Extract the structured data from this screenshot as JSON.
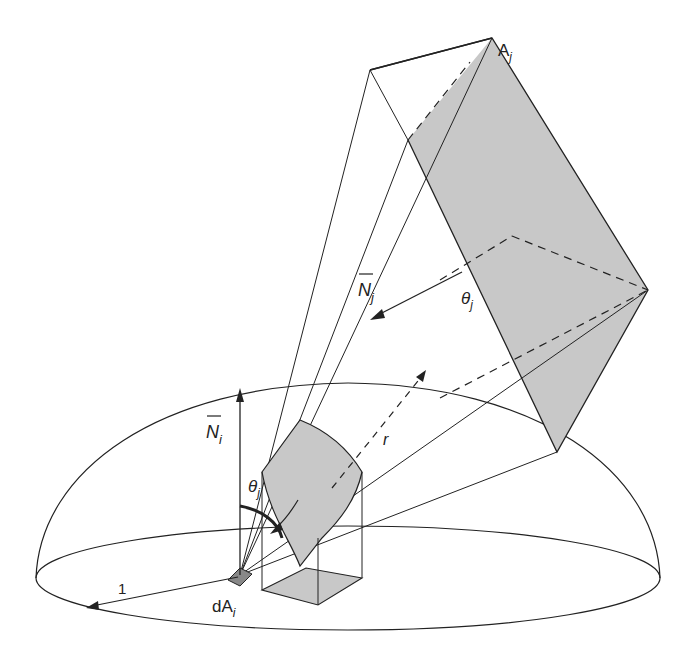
{
  "labels": {
    "A_main": "A",
    "A_sub": "j",
    "Nj_main": "N",
    "Nj_sub": "j",
    "theta_j_upper_main": "θ",
    "theta_j_upper_sub": "j",
    "r": "r",
    "Ni_main": "N",
    "Ni_sub": "i",
    "theta_j_lower_main": "θ",
    "theta_j_lower_sub": "j",
    "unit_radius": "1",
    "dA_main": "dA",
    "dA_sub": "i"
  },
  "colors": {
    "shade": "#c8c8c8",
    "stroke": "#222222"
  }
}
